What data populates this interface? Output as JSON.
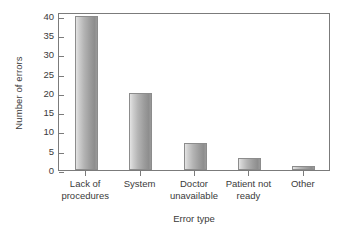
{
  "chart_data": {
    "type": "bar",
    "title": "",
    "subtitle": "",
    "xlabel": "Error type",
    "ylabel": "Number of errors",
    "categories": [
      "Lack of\nprocedures",
      "System",
      "Doctor\nunavailable",
      "Patient not\nready",
      "Other"
    ],
    "values": [
      40,
      20,
      7,
      3,
      1
    ],
    "ylim": [
      0,
      41
    ],
    "yticks": [
      0,
      5,
      10,
      15,
      20,
      25,
      30,
      35,
      40
    ],
    "ytick_labels": [
      "0",
      "5",
      "10",
      "15",
      "20",
      "25",
      "30",
      "35",
      "40"
    ],
    "grid": false,
    "legend": null,
    "legend_position": "none",
    "bar_fill": "#b0b0b0",
    "bar_edge": "#8c8c8c",
    "axis_color": "#7b7b7b",
    "text_color": "#3a3a3a",
    "background": "#ffffff"
  },
  "axes": {
    "y_title": "Number of errors",
    "x_title": "Error type"
  }
}
